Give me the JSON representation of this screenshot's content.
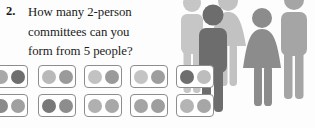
{
  "question": {
    "number": "2.",
    "lines": [
      "How many 2-person",
      "committees can you",
      "form from 5 people?"
    ],
    "full_text": "How many 2-person committees can you form from 5 people?"
  },
  "palette": {
    "dot_dark": "#6e6e6e",
    "dot_mid": "#8f8f8f",
    "dot_light": "#b9b9b9",
    "dot_pale": "#c9c9c9",
    "cell_border": "#8d8d8d",
    "figure_front_dark": "#6b6b6b",
    "figure_front_mid": "#8a8a8a",
    "figure_back_light": "#bfbfbf",
    "figure_back_pale": "#cfcfcf",
    "text": "#1b1b1b",
    "background": "#fdfdfd"
  },
  "pairs": {
    "count": 10,
    "description": "Ten two-dot cells showing every pairing of 5 people",
    "rows": [
      {
        "row": 1,
        "cells": [
          {
            "left": "#a9a9a9",
            "right": "#6e6e6e"
          },
          {
            "left": "#b9b9b9",
            "right": "#9a9a9a"
          },
          {
            "left": "#c2c2c2",
            "right": "#9a9a9a"
          },
          {
            "left": "#c4c4c4",
            "right": "#9e9e9e"
          },
          {
            "left": "#6e6e6e",
            "right": "#bdbdbd"
          }
        ]
      },
      {
        "row": 2,
        "cells": [
          {
            "left": "#8a8a8a",
            "right": "#a0a0a0"
          },
          {
            "left": "#787878",
            "right": "#8d8d8d"
          },
          {
            "left": "#b0b0b0",
            "right": "#a8a8a8"
          },
          {
            "left": "#a4a4a4",
            "right": "#9e9e9e"
          },
          {
            "left": "#b4b4b4",
            "right": "#a6a6a6"
          }
        ]
      }
    ]
  },
  "figures": [
    {
      "id": "back-left-man",
      "type": "man",
      "color": "#c6c6c6",
      "layer": "back"
    },
    {
      "id": "back-center-woman",
      "type": "woman",
      "color": "#c2c2c2",
      "layer": "back"
    },
    {
      "id": "back-right-man",
      "type": "man",
      "color": "#a5a5a5",
      "layer": "back"
    },
    {
      "id": "front-man",
      "type": "man",
      "color": "#6d6d6d",
      "layer": "front"
    },
    {
      "id": "front-woman",
      "type": "woman",
      "color": "#8c8c8c",
      "layer": "front"
    }
  ]
}
